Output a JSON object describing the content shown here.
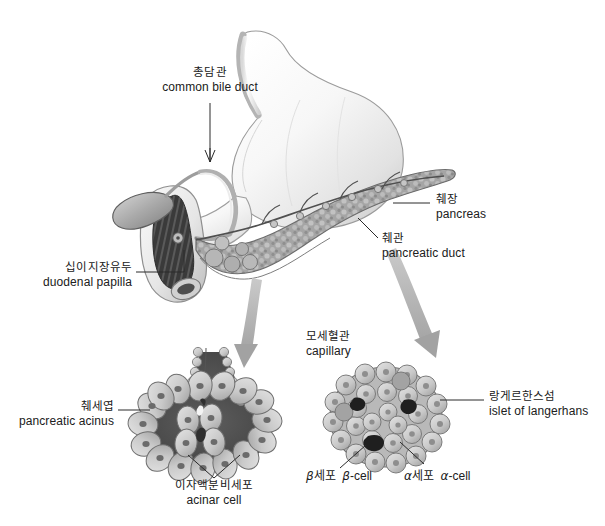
{
  "figure": {
    "background_color": "#ffffff",
    "ink_color": "#202020"
  },
  "labels": {
    "common_bile_duct": {
      "ko": "총담관",
      "en": "common bile duct"
    },
    "pancreas": {
      "ko": "췌장",
      "en": "pancreas"
    },
    "pancreatic_duct": {
      "ko": "췌관",
      "en": "pancreatic duct"
    },
    "duodenal_papilla": {
      "ko": "십이지장유두",
      "en": "duodenal papilla"
    },
    "capillary": {
      "ko": "모세혈관",
      "en": "capillary"
    },
    "islet_of_langerhans": {
      "ko": "랑게르한스섬",
      "en": "islet of langerhans"
    },
    "pancreatic_acinus": {
      "ko": "췌세엽",
      "en": "pancreatic acinus"
    },
    "acinar_cell": {
      "ko": "이자액분비세포",
      "en": "acinar cell"
    },
    "beta_cell": {
      "ko_prefix": "β",
      "ko": "세포",
      "en_prefix": "β",
      "en": "-cell"
    },
    "alpha_cell": {
      "ko_prefix": "α",
      "ko": "세포",
      "en_prefix": "α",
      "en": "-cell"
    }
  },
  "structures": {
    "stomach": "stomach",
    "duodenum": "duodenum",
    "gallbladder": "gallbladder",
    "pancreas_body": "pancreas-body",
    "acinus_inset": "pancreatic-acinus-inset",
    "islet_inset": "islet-of-langerhans-inset"
  },
  "colors": {
    "organ_light": "#f2f2f2",
    "organ_mid": "#c9c9c9",
    "organ_dark": "#6f6f6f",
    "lumen_dark": "#4a4a4a",
    "cell_fill": "#cfcfcf",
    "nucleus": "#6b6b6b",
    "arrow_gray": "#a8a8a8",
    "leader": "#2a2a2a"
  }
}
